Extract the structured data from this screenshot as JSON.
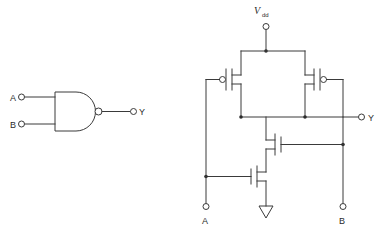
{
  "figure": {
    "type": "circuit-schematic"
  },
  "symbol": {
    "gate_name": "nand-gate",
    "inputs": [
      {
        "label": "A",
        "name": "input-a"
      },
      {
        "label": "B",
        "name": "input-b"
      }
    ],
    "output": {
      "label": "Y",
      "name": "output-y"
    },
    "has_inversion_bubble": true
  },
  "schematic": {
    "supply": {
      "label_main": "V",
      "label_sub": "dd",
      "name": "vdd-terminal"
    },
    "ground": {
      "name": "ground-symbol",
      "style": "triangle"
    },
    "inputs": [
      {
        "label": "A",
        "name": "schematic-input-a"
      },
      {
        "label": "B",
        "name": "schematic-input-b"
      }
    ],
    "output": {
      "label": "Y",
      "name": "schematic-output-y"
    },
    "transistors": [
      {
        "name": "pmos-a",
        "type": "PMOS",
        "gate_net": "A",
        "position": "upper-left"
      },
      {
        "name": "pmos-b",
        "type": "PMOS",
        "gate_net": "B",
        "position": "upper-right"
      },
      {
        "name": "nmos-b",
        "type": "NMOS",
        "gate_net": "B",
        "position": "lower-upper"
      },
      {
        "name": "nmos-a",
        "type": "NMOS",
        "gate_net": "A",
        "position": "lower-lower"
      }
    ]
  },
  "colors": {
    "line": "#3a3a3a",
    "text": "#2b2b2b",
    "background": "#ffffff"
  }
}
